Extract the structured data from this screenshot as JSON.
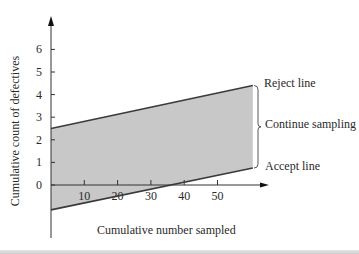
{
  "chart_data": {
    "type": "line",
    "title": "",
    "xlabel": "Cumulative number sampled",
    "ylabel": "Cumulative count of defectives",
    "x_ticks": [
      10,
      20,
      30,
      40,
      50
    ],
    "y_ticks": [
      0,
      1,
      2,
      3,
      4,
      5,
      6
    ],
    "xlim": [
      0,
      65
    ],
    "ylim": [
      -2.3,
      7
    ],
    "grid": false,
    "series": [
      {
        "name": "Reject line",
        "x": [
          0,
          60.6
        ],
        "y": [
          2.5,
          4.4
        ]
      },
      {
        "name": "Accept line",
        "x": [
          0,
          60.6
        ],
        "y": [
          -1.1,
          0.75
        ]
      }
    ],
    "shaded_region": {
      "name": "Continue sampling",
      "between": [
        "Accept line",
        "Reject line"
      ],
      "color": "#c8c8c8"
    },
    "annotations": [
      {
        "text": "Reject line",
        "target": "Reject line"
      },
      {
        "text": "Continue sampling",
        "target": "region between lines",
        "bracket": true
      },
      {
        "text": "Accept line",
        "target": "Accept line"
      }
    ]
  },
  "labels": {
    "xlabel": "Cumulative number sampled",
    "ylabel": "Cumulative count of defectives",
    "reject": "Reject line",
    "continue": "Continue sampling",
    "accept": "Accept line"
  },
  "colors": {
    "line": "#3a3a3a",
    "fill": "#c8c8c8",
    "axis": "#333333"
  }
}
